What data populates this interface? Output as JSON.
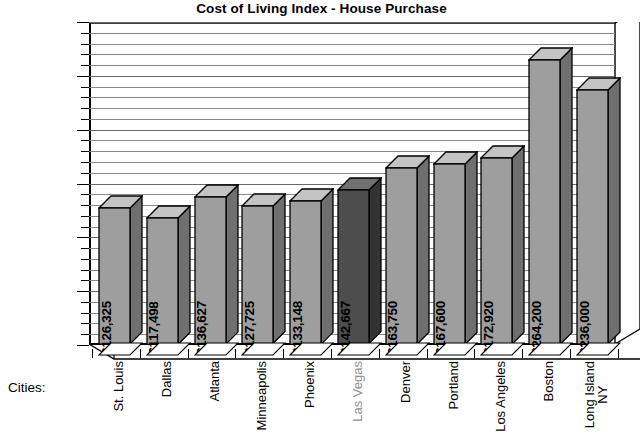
{
  "chart_data": {
    "type": "bar",
    "title": "Cost of Living Index - House Purchase",
    "xlabel": "Cities:",
    "ylabel": "",
    "ylim": [
      0,
      300000
    ],
    "ytick_step": 50000,
    "minor_tick_step": 10000,
    "grid": true,
    "legend": "none",
    "value_prefix": "$",
    "three_d": true,
    "categories": [
      "St. Louis",
      "Dallas",
      "Atlanta",
      "Minneapolis",
      "Phoenix",
      "Las Vegas",
      "Denver",
      "Portland",
      "Los Angeles",
      "Boston",
      "Long Island NY"
    ],
    "values": [
      126325,
      117498,
      136627,
      127725,
      133148,
      142667,
      163750,
      167600,
      172920,
      264200,
      236000
    ],
    "value_labels": [
      "$126,325",
      "$117,498",
      "$136,627",
      "$127,725",
      "$133,148",
      "$142,667",
      "$163,750",
      "$167,600",
      "$172,920",
      "$264,200",
      "$236,000"
    ],
    "ytick_labels": [
      "$0",
      "$50,000",
      "$100,000",
      "$150,000",
      "$200,000",
      "$250,000",
      "$300,000"
    ],
    "ytick_values": [
      0,
      50000,
      100000,
      150000,
      200000,
      250000,
      300000
    ],
    "highlight_index": 5,
    "colors": {
      "bar_face": "#9e9e9e",
      "bar_top": "#c4c4c4",
      "bar_side": "#6f6f6f",
      "bar_highlight_face": "#4d4d4d",
      "bar_highlight_top": "#707070",
      "bar_highlight_side": "#333333",
      "gridline": "#8a8a8a",
      "axis": "#000000",
      "text": "#000000",
      "highlight_label_text": "#8e8e8e",
      "background": "#ffffff"
    }
  },
  "axis": {
    "cities_caption": "Cities:"
  }
}
